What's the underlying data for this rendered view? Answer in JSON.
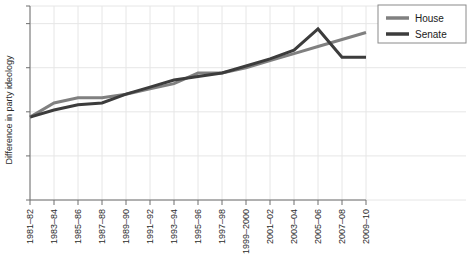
{
  "chart_data": {
    "type": "line",
    "title": "",
    "subtitle": "",
    "xlabel": "",
    "ylabel": "Difference in party ideology",
    "grid": true,
    "legend_position": "top-right",
    "ylim": [
      0,
      1.1
    ],
    "y_ticks_labeled": false,
    "y_tick_count": 5,
    "categories": [
      "1981–82",
      "1983–84",
      "1985–86",
      "1987–88",
      "1989–90",
      "1991–92",
      "1993–94",
      "1995–96",
      "1997–98",
      "1999–2000",
      "2001–02",
      "2003–04",
      "2005–06",
      "2007–08",
      "2009–10"
    ],
    "series": [
      {
        "name": "House",
        "color": "#808080",
        "values": [
          0.47,
          0.55,
          0.58,
          0.58,
          0.6,
          0.63,
          0.66,
          0.72,
          0.72,
          0.75,
          0.79,
          0.83,
          0.87,
          0.91,
          0.95
        ]
      },
      {
        "name": "Senate",
        "color": "#3c3c3c",
        "values": [
          0.47,
          0.51,
          0.54,
          0.55,
          0.6,
          0.64,
          0.68,
          0.7,
          0.72,
          0.76,
          0.8,
          0.85,
          0.97,
          0.81,
          0.81
        ]
      }
    ]
  },
  "legend": {
    "entries": [
      {
        "label": "House",
        "color": "#808080"
      },
      {
        "label": "Senate",
        "color": "#3c3c3c"
      }
    ]
  },
  "axes": {
    "y_title": "Difference in party ideology"
  }
}
